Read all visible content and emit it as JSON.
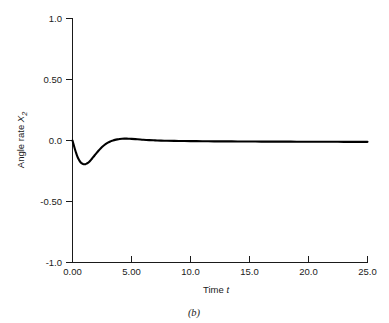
{
  "figure": {
    "caption": "(b)",
    "background_color": "#ffffff",
    "line_color": "#000000",
    "axis_color": "#1a1a1a"
  },
  "chart_data": {
    "type": "line",
    "title": "",
    "subtitle": "",
    "xlabel": "Time t",
    "xlabel_parts": {
      "text": "Time ",
      "italic": "t"
    },
    "ylabel": "Angle rate X2",
    "ylabel_parts": {
      "text": "Angle rate ",
      "italic": "X",
      "subscript": "2"
    },
    "xlim": [
      0.0,
      25.0
    ],
    "ylim": [
      -1.0,
      1.0
    ],
    "xticks": [
      0,
      5,
      10,
      15,
      20,
      25
    ],
    "xtick_labels": [
      "0.00",
      "5.00",
      "10.0",
      "15.0",
      "20.0",
      "25.0"
    ],
    "yticks": [
      -1.0,
      -0.5,
      0.0,
      0.5,
      1.0
    ],
    "ytick_labels": [
      "-1.0",
      "-0.50",
      "0.0",
      "0.50",
      "1.0"
    ],
    "grid": false,
    "legend": null,
    "legend_position": "none",
    "series": [
      {
        "name": "Angle rate X2",
        "color": "#000000",
        "x": [
          0.0,
          0.1,
          0.2,
          0.3,
          0.4,
          0.5,
          0.6,
          0.7,
          0.8,
          0.9,
          1.0,
          1.1,
          1.2,
          1.3,
          1.4,
          1.5,
          1.6,
          1.7,
          1.8,
          1.9,
          2.0,
          2.2,
          2.4,
          2.6,
          2.8,
          3.0,
          3.2,
          3.4,
          3.6,
          3.8,
          4.0,
          4.2,
          4.4,
          4.6,
          4.8,
          5.0,
          5.5,
          6.0,
          6.5,
          7.0,
          7.5,
          8.0,
          9.0,
          10.0,
          11.0,
          12.0,
          13.0,
          14.0,
          15.0,
          16.0,
          17.0,
          18.0,
          19.0,
          20.0,
          21.0,
          22.0,
          23.0,
          24.0,
          25.0
        ],
        "y": [
          0.0,
          -0.035,
          -0.07,
          -0.1,
          -0.128,
          -0.15,
          -0.167,
          -0.18,
          -0.188,
          -0.193,
          -0.195,
          -0.194,
          -0.19,
          -0.184,
          -0.176,
          -0.166,
          -0.155,
          -0.143,
          -0.131,
          -0.119,
          -0.107,
          -0.084,
          -0.063,
          -0.045,
          -0.03,
          -0.018,
          -0.008,
          -0.001,
          0.005,
          0.009,
          0.012,
          0.014,
          0.015,
          0.015,
          0.014,
          0.013,
          0.01,
          0.006,
          0.003,
          0.001,
          -0.001,
          -0.002,
          -0.004,
          -0.005,
          -0.006,
          -0.007,
          -0.007,
          -0.008,
          -0.008,
          -0.009,
          -0.009,
          -0.009,
          -0.01,
          -0.01,
          -0.01,
          -0.01,
          -0.011,
          -0.011,
          -0.011
        ]
      }
    ],
    "annotations": [
      {
        "id": "min-point",
        "t": 1.0,
        "value": -0.195,
        "label": ""
      },
      {
        "id": "overshoot-point",
        "t": 4.4,
        "value": 0.015,
        "label": ""
      }
    ]
  }
}
